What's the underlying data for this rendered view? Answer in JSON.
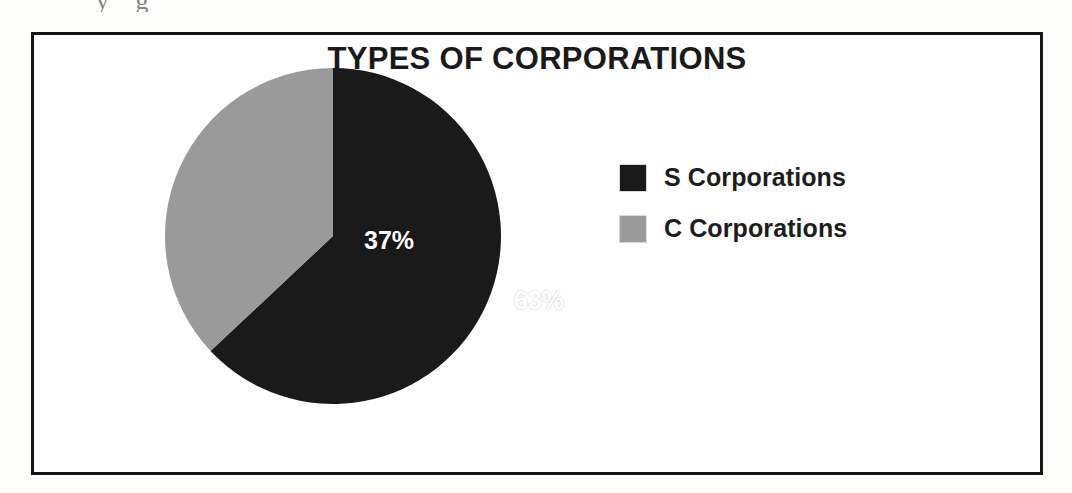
{
  "artifact": {
    "clipped_text": "y   g"
  },
  "chart_data": {
    "type": "pie",
    "title": "TYPES OF CORPORATIONS",
    "categories": [
      "S Corporations",
      "C Corporations"
    ],
    "values": [
      63,
      37
    ],
    "value_labels": [
      "63%",
      "37%"
    ],
    "colors": [
      "#1a1a1a",
      "#9a9a9a"
    ],
    "units": "percent",
    "start_angle_deg": 0,
    "direction": "clockwise",
    "legend_position": "right",
    "grid": false,
    "xlabel": "",
    "ylabel": "",
    "slices": [
      {
        "name": "S Corporations",
        "value": 63,
        "label": "63%",
        "color": "#1a1a1a"
      },
      {
        "name": "C Corporations",
        "value": 37,
        "label": "37%",
        "color": "#9a9a9a"
      }
    ]
  },
  "legend": {
    "items": [
      {
        "label": "S Corporations",
        "color": "#1a1a1a"
      },
      {
        "label": "C Corporations",
        "color": "#9a9a9a"
      }
    ]
  }
}
